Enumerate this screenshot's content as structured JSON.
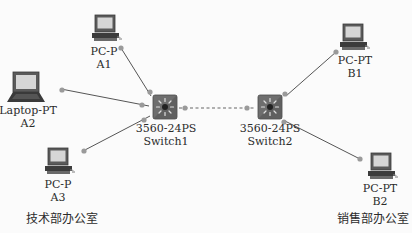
{
  "diagram": {
    "type": "network-topology",
    "devices": [
      {
        "id": "pc_a1",
        "kind": "pc",
        "model": "PC-P",
        "name": "A1"
      },
      {
        "id": "laptop_a2",
        "kind": "laptop",
        "model": "Laptop-PT",
        "name": "A2"
      },
      {
        "id": "pc_a3",
        "kind": "pc",
        "model": "PC-P",
        "name": "A3"
      },
      {
        "id": "switch1",
        "kind": "switch",
        "model": "3560-24PS",
        "name": "Switch1"
      },
      {
        "id": "switch2",
        "kind": "switch",
        "model": "3560-24PS",
        "name": "Switch2"
      },
      {
        "id": "pc_b1",
        "kind": "pc",
        "model": "PC-PT",
        "name": "B1"
      },
      {
        "id": "pc_b2",
        "kind": "pc",
        "model": "PC-PT",
        "name": "B2"
      }
    ],
    "links": [
      {
        "from": "pc_a1",
        "to": "switch1",
        "style": "solid"
      },
      {
        "from": "laptop_a2",
        "to": "switch1",
        "style": "solid"
      },
      {
        "from": "pc_a3",
        "to": "switch1",
        "style": "solid"
      },
      {
        "from": "switch1",
        "to": "switch2",
        "style": "dashed"
      },
      {
        "from": "switch2",
        "to": "pc_b1",
        "style": "solid"
      },
      {
        "from": "switch2",
        "to": "pc_b2",
        "style": "solid"
      }
    ],
    "areas": {
      "tech_office": "技术部办公室",
      "sales_office": "销售部办公室"
    },
    "colors": {
      "link": "#555555",
      "port_dot": "#9a9a9a",
      "switch_body": "#6b6b6b",
      "screen": "#d8d8d8"
    }
  }
}
